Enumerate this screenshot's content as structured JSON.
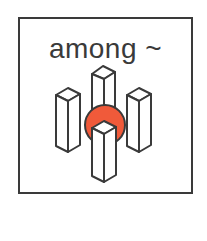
{
  "symbol": {
    "label": "among ~",
    "concept": "among",
    "colors": {
      "stroke": "#3a3a3a",
      "highlight": "#f05a3a",
      "fill": "#ffffff",
      "border": "#3a3a3a"
    },
    "icons": [
      "pillar-icon",
      "pillar-icon",
      "pillar-icon",
      "pillar-icon",
      "circle-icon"
    ]
  }
}
